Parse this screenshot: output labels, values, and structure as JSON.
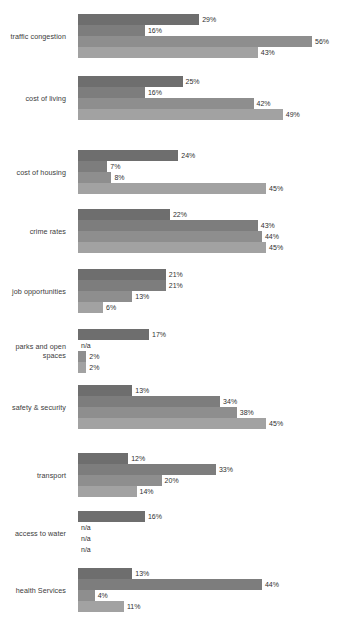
{
  "chart_data": {
    "type": "bar",
    "orientation": "horizontal",
    "title": "",
    "subtitle": "",
    "xlabel": "",
    "ylabel": "",
    "xlim": [
      0,
      56
    ],
    "grid": false,
    "legend": null,
    "value_suffix": "%",
    "na_label": "n/a",
    "series": [
      {
        "name": "series-1",
        "color": "#6e6e6e",
        "values": [
          29,
          25,
          24,
          22,
          21,
          17,
          13,
          12,
          16,
          13
        ]
      },
      {
        "name": "series-2",
        "color": "#7d7d7d",
        "values": [
          16,
          16,
          7,
          43,
          21,
          null,
          34,
          33,
          null,
          44
        ]
      },
      {
        "name": "series-3",
        "color": "#8e8e8e",
        "values": [
          56,
          42,
          8,
          44,
          13,
          2,
          38,
          20,
          null,
          4
        ]
      },
      {
        "name": "series-4",
        "color": "#a2a2a2",
        "values": [
          43,
          49,
          45,
          45,
          6,
          2,
          45,
          14,
          null,
          11
        ]
      }
    ],
    "categories": [
      "traffic congestion",
      "cost of living",
      "cost of housing",
      "crime rates",
      "job opportunities",
      "parks and open spaces",
      "safety & security",
      "transport",
      "access to water",
      "health Services"
    ],
    "groups": [
      {
        "label": "traffic congestion",
        "bars": [
          {
            "value": 29,
            "label": "29%"
          },
          {
            "value": 16,
            "label": "16%"
          },
          {
            "value": 56,
            "label": "56%"
          },
          {
            "value": 43,
            "label": "43%"
          }
        ]
      },
      {
        "label": "cost of living",
        "bars": [
          {
            "value": 25,
            "label": "25%"
          },
          {
            "value": 16,
            "label": "16%"
          },
          {
            "value": 42,
            "label": "42%"
          },
          {
            "value": 49,
            "label": "49%"
          }
        ]
      },
      {
        "label": "cost of housing",
        "bars": [
          {
            "value": 24,
            "label": "24%"
          },
          {
            "value": 7,
            "label": "7%"
          },
          {
            "value": 8,
            "label": "8%"
          },
          {
            "value": 45,
            "label": "45%"
          }
        ]
      },
      {
        "label": "crime rates",
        "bars": [
          {
            "value": 22,
            "label": "22%"
          },
          {
            "value": 43,
            "label": "43%"
          },
          {
            "value": 44,
            "label": "44%"
          },
          {
            "value": 45,
            "label": "45%"
          }
        ]
      },
      {
        "label": "job opportunities",
        "bars": [
          {
            "value": 21,
            "label": "21%"
          },
          {
            "value": 21,
            "label": "21%"
          },
          {
            "value": 13,
            "label": "13%"
          },
          {
            "value": 6,
            "label": "6%"
          }
        ]
      },
      {
        "label": "parks and open spaces",
        "bars": [
          {
            "value": 17,
            "label": "17%"
          },
          {
            "value": null,
            "label": "n/a"
          },
          {
            "value": 2,
            "label": "2%"
          },
          {
            "value": 2,
            "label": "2%"
          }
        ]
      },
      {
        "label": "safety & security",
        "bars": [
          {
            "value": 13,
            "label": "13%"
          },
          {
            "value": 34,
            "label": "34%"
          },
          {
            "value": 38,
            "label": "38%"
          },
          {
            "value": 45,
            "label": "45%"
          }
        ]
      },
      {
        "label": "transport",
        "bars": [
          {
            "value": 12,
            "label": "12%"
          },
          {
            "value": 33,
            "label": "33%"
          },
          {
            "value": 20,
            "label": "20%"
          },
          {
            "value": 14,
            "label": "14%"
          }
        ]
      },
      {
        "label": "access to water",
        "bars": [
          {
            "value": 16,
            "label": "16%"
          },
          {
            "value": null,
            "label": "n/a"
          },
          {
            "value": null,
            "label": "n/a"
          },
          {
            "value": null,
            "label": "n/a"
          }
        ]
      },
      {
        "label": "health Services",
        "bars": [
          {
            "value": 13,
            "label": "13%"
          },
          {
            "value": 44,
            "label": "44%"
          },
          {
            "value": 4,
            "label": "4%"
          },
          {
            "value": 11,
            "label": "11%"
          }
        ]
      }
    ]
  },
  "layout": {
    "bar_height_px": 11,
    "px_per_percent": 4.18,
    "bar_origin_x_px": 78,
    "group_top_offsets_px": [
      14,
      76,
      150,
      209,
      269,
      329,
      385,
      453,
      511,
      568
    ],
    "label_width_px": 72,
    "canvas": {
      "width_px": 345,
      "height_px": 630
    },
    "background": "#ffffff"
  }
}
